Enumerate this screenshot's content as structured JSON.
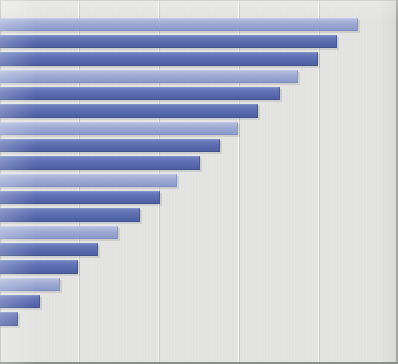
{
  "chart": {
    "title": "",
    "subtitle": "",
    "type": "horizontal-bar"
  },
  "style": {
    "background_color": "#e6e7e5",
    "gridline_color": "#fbfcfb",
    "bar_color_light": "#9aa8d4",
    "bar_color_dark": "#5c6fb5",
    "axis_border_color": "#8f918f"
  },
  "chart_data": {
    "type": "bar",
    "orientation": "horizontal",
    "title": "",
    "xlabel": "",
    "ylabel": "",
    "grid": true,
    "legend": "none",
    "xlim": [
      0,
      398
    ],
    "gridline_positions": [
      78,
      158,
      238,
      318
    ],
    "categories": [
      "1",
      "2",
      "3",
      "4",
      "5",
      "6",
      "7",
      "8",
      "9",
      "10",
      "11",
      "12",
      "13",
      "14",
      "15",
      "16",
      "17",
      "18",
      "19"
    ],
    "values": [
      358,
      337,
      318,
      298,
      280,
      258,
      238,
      220,
      200,
      177,
      160,
      140,
      118,
      98,
      78,
      60,
      40,
      18,
      0
    ],
    "bars": [
      {
        "index": 1,
        "value": 358,
        "shade": "light",
        "top": 18,
        "height": 13
      },
      {
        "index": 2,
        "value": 337,
        "shade": "dark",
        "top": 35,
        "height": 13
      },
      {
        "index": 3,
        "value": 318,
        "shade": "dark",
        "top": 52,
        "height": 14
      },
      {
        "index": 4,
        "value": 298,
        "shade": "light",
        "top": 70,
        "height": 13
      },
      {
        "index": 5,
        "value": 280,
        "shade": "dark",
        "top": 87,
        "height": 13
      },
      {
        "index": 6,
        "value": 258,
        "shade": "dark",
        "top": 104,
        "height": 14
      },
      {
        "index": 7,
        "value": 238,
        "shade": "light",
        "top": 122,
        "height": 13
      },
      {
        "index": 8,
        "value": 220,
        "shade": "dark",
        "top": 139,
        "height": 13
      },
      {
        "index": 9,
        "value": 200,
        "shade": "dark",
        "top": 156,
        "height": 14
      },
      {
        "index": 10,
        "value": 177,
        "shade": "light",
        "top": 174,
        "height": 13
      },
      {
        "index": 11,
        "value": 160,
        "shade": "dark",
        "top": 191,
        "height": 13
      },
      {
        "index": 12,
        "value": 140,
        "shade": "dark",
        "top": 208,
        "height": 14
      },
      {
        "index": 13,
        "value": 118,
        "shade": "light",
        "top": 226,
        "height": 13
      },
      {
        "index": 14,
        "value": 98,
        "shade": "dark",
        "top": 243,
        "height": 13
      },
      {
        "index": 15,
        "value": 78,
        "shade": "dark",
        "top": 260,
        "height": 14
      },
      {
        "index": 16,
        "value": 60,
        "shade": "light",
        "top": 278,
        "height": 13
      },
      {
        "index": 17,
        "value": 40,
        "shade": "dark",
        "top": 295,
        "height": 13
      },
      {
        "index": 18,
        "value": 18,
        "shade": "dark",
        "top": 312,
        "height": 14
      },
      {
        "index": 19,
        "value": 0,
        "shade": "light",
        "top": 330,
        "height": 13
      }
    ]
  }
}
